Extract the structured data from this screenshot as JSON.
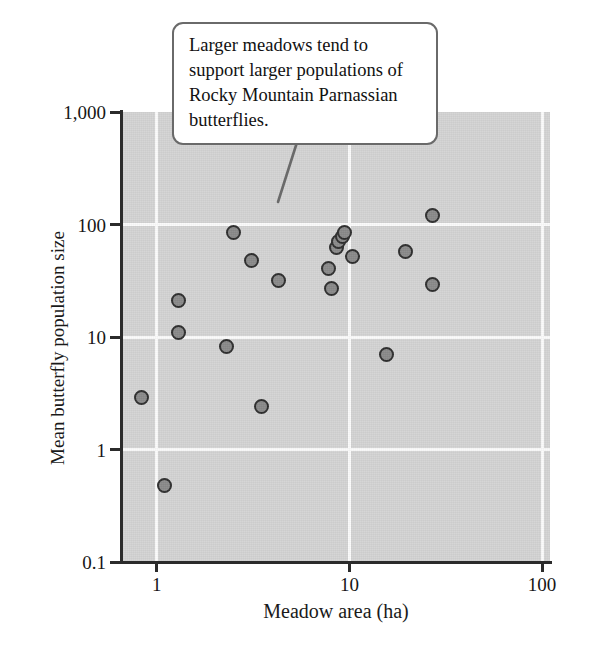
{
  "figure": {
    "background_color": "#ffffff",
    "plot_background_color": "#d4d4d4",
    "gridline_color": "#fbfbfb",
    "axis_color": "#2b2b2b",
    "marker_fill_color": "#8a8a8a",
    "marker_edge_color": "#2e2e2e",
    "callout_border_color": "#6a6a6a"
  },
  "callout": {
    "text": "Larger meadows tend to support larger populations of Rocky Mountain Parnassian butterflies."
  },
  "caption_fragment": "",
  "axes": {
    "x_title": "Meadow area (ha)",
    "y_title": "Mean butterfly population size",
    "x_ticks": [
      "1",
      "10",
      "100"
    ],
    "y_ticks": [
      "1,000",
      "100",
      "10",
      "1",
      "0.1"
    ]
  },
  "chart_data": {
    "type": "scatter",
    "title": "",
    "xlabel": "Meadow area (ha)",
    "ylabel": "Mean butterfly population size",
    "xscale": "log",
    "yscale": "log",
    "xlim": [
      0.66,
      110
    ],
    "ylim": [
      0.1,
      1000
    ],
    "xticks": [
      1,
      10,
      100
    ],
    "xticklabels": [
      "1",
      "10",
      "100"
    ],
    "yticks": [
      0.1,
      1,
      10,
      100,
      1000
    ],
    "yticklabels": [
      "0.1",
      "1",
      "10",
      "100",
      "1,000"
    ],
    "grid": true,
    "grid_color": "#fbfbfb",
    "legend": false,
    "annotations": [
      {
        "text": "Larger meadows tend to support larger populations of Rocky Mountain Parnassian butterflies.",
        "points_to_x": 2.5,
        "points_to_y": 170
      }
    ],
    "points": [
      {
        "x": 0.83,
        "y": 2.9
      },
      {
        "x": 1.1,
        "y": 0.48
      },
      {
        "x": 1.3,
        "y": 21
      },
      {
        "x": 1.3,
        "y": 11
      },
      {
        "x": 2.3,
        "y": 8.2
      },
      {
        "x": 2.5,
        "y": 85
      },
      {
        "x": 3.1,
        "y": 48
      },
      {
        "x": 3.5,
        "y": 2.4
      },
      {
        "x": 4.3,
        "y": 32
      },
      {
        "x": 7.8,
        "y": 41
      },
      {
        "x": 8.1,
        "y": 27
      },
      {
        "x": 8.6,
        "y": 63
      },
      {
        "x": 8.8,
        "y": 70
      },
      {
        "x": 9.2,
        "y": 78
      },
      {
        "x": 9.4,
        "y": 85
      },
      {
        "x": 10.4,
        "y": 52
      },
      {
        "x": 15.5,
        "y": 7.0
      },
      {
        "x": 19.5,
        "y": 57
      },
      {
        "x": 27,
        "y": 120
      },
      {
        "x": 27,
        "y": 29
      }
    ]
  }
}
